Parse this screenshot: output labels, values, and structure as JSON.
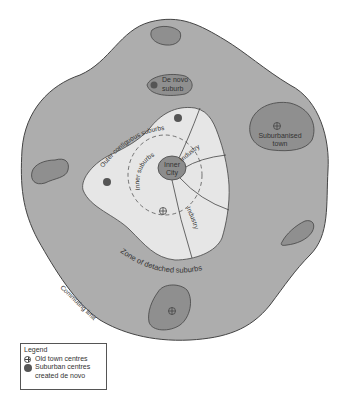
{
  "diagram": {
    "regions": {
      "commuting_zone_fill": "#adadad",
      "contiguous_suburbs_fill": "#e6e6e6",
      "inner_city_fill": "#8c8c8c",
      "satellite_fill": "#8f8f8f",
      "outline": "#444444"
    },
    "labels": {
      "de_novo_suburb_line1": "De novo",
      "de_novo_suburb_line2": "suburb",
      "suburbanised_town_line1": "Suburbanised",
      "suburbanised_town_line2": "town",
      "outer_contiguous_suburbs": "Outer contiguous suburbs",
      "inner_suburbs": "Inner suburbs",
      "inner_city_line1": "Inner",
      "inner_city_line2": "City",
      "industry_upper": "Industry",
      "industry_lower": "Industry",
      "zone_detached_suburbs": "Zone of detached suburbs",
      "commuting_limit": "Commuting limit"
    }
  },
  "legend": {
    "title": "Legend",
    "items": [
      {
        "symbol": "circle-cross-icon",
        "label": "Old town centres"
      },
      {
        "symbol": "filled-dot-icon",
        "label": "Suburban centres"
      },
      {
        "symbol": "",
        "label": "created de novo"
      }
    ]
  }
}
